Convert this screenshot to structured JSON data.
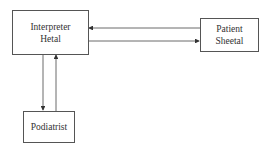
{
  "nodes": {
    "interpreter": {
      "line1": "Interpreter",
      "line2": "Hetal"
    },
    "patient": {
      "line1": "Patient",
      "line2": "Sheetal"
    },
    "podiatrist": {
      "label": "Podiatrist"
    }
  },
  "edges": [
    {
      "from": "patient",
      "to": "interpreter"
    },
    {
      "from": "interpreter",
      "to": "patient"
    },
    {
      "from": "interpreter",
      "to": "podiatrist"
    },
    {
      "from": "podiatrist",
      "to": "interpreter"
    }
  ]
}
